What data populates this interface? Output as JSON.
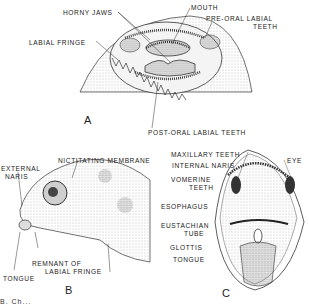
{
  "figure": {
    "panels": [
      {
        "id": "A",
        "letter": "A",
        "subject": "tadpole mouth (oral disc)",
        "labels": {
          "horny_jaws": "HORNY JAWS",
          "mouth": "MOUTH",
          "pre_oral_1": "PRE-ORAL LABIAL",
          "pre_oral_2": "TEETH",
          "labial_fringe": "LABIAL FRINGE",
          "post_oral": "POST-ORAL LABIAL TEETH"
        }
      },
      {
        "id": "B",
        "letter": "B",
        "subject": "metamorphosing frog head, lateral view",
        "labels": {
          "external_naris_1": "EXTERNAL",
          "external_naris_2": "NARIS",
          "nictitating": "NICTITATING MEMBRANE",
          "remnant_1": "REMNANT OF",
          "remnant_2": "LABIAL FRINGE",
          "tongue": "TONGUE"
        }
      },
      {
        "id": "C",
        "letter": "C",
        "subject": "frog open mouth, interior view",
        "labels": {
          "maxillary": "MAXILLARY TEETH",
          "internal_naris": "INTERNAL NARIS",
          "eye": "EYE",
          "vomerine_1": "VOMERINE",
          "vomerine_2": "TEETH",
          "esophagus": "ESOPHAGUS",
          "eustachian_1": "EUSTACHIAN",
          "eustachian_2": "TUBE",
          "glottis": "GLOTTIS",
          "tongue": "TONGUE"
        }
      }
    ],
    "caption_fragment": "B. Ch..."
  }
}
